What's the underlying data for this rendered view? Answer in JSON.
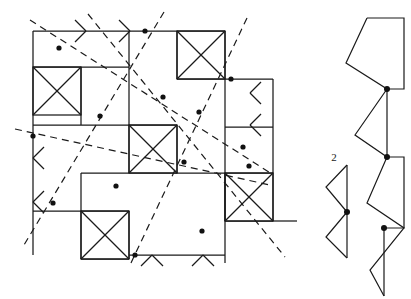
{
  "figure": {
    "kind": "geometric-line-diagram",
    "background_color": "#ffffff",
    "stroke_color": "#1a1a1a",
    "width": 411,
    "height": 299,
    "labels": [
      {
        "id": "label-2",
        "text": "2",
        "x": 334,
        "y": 161
      }
    ],
    "left_panel": {
      "name": "pinwheel-tiling-panel",
      "grid_origin_x": 33,
      "grid_origin_y": 31,
      "cell_size": 48,
      "description": "Square tiling of orthogonal segments with X-crossed cells, overlaid by dashed lines carrying marked vertex dots, with arrowheads along boundary edges.",
      "orthogonal_segments": [
        [
          33,
          31,
          33,
          255
        ],
        [
          33,
          31,
          81,
          31
        ],
        [
          81,
          31,
          129,
          31
        ],
        [
          129,
          31,
          177,
          31
        ],
        [
          177,
          31,
          225,
          31
        ],
        [
          33,
          67,
          81,
          67
        ],
        [
          81,
          67,
          129,
          67
        ],
        [
          177,
          31,
          177,
          79
        ],
        [
          225,
          31,
          225,
          79
        ],
        [
          33,
          125,
          81,
          125
        ],
        [
          81,
          125,
          129,
          125
        ],
        [
          129,
          125,
          177,
          125
        ],
        [
          81,
          67,
          81,
          125
        ],
        [
          129,
          31,
          129,
          125
        ],
        [
          177,
          79,
          225,
          79
        ],
        [
          225,
          79,
          273,
          79
        ],
        [
          225,
          79,
          225,
          127
        ],
        [
          273,
          79,
          273,
          127
        ],
        [
          129,
          125,
          129,
          173
        ],
        [
          177,
          125,
          177,
          173
        ],
        [
          129,
          173,
          177,
          173
        ],
        [
          177,
          173,
          225,
          173
        ],
        [
          225,
          127,
          273,
          127
        ],
        [
          33,
          211,
          81,
          211
        ],
        [
          81,
          211,
          129,
          211
        ],
        [
          81,
          173,
          81,
          211
        ],
        [
          81,
          173,
          129,
          173
        ],
        [
          225,
          173,
          225,
          221
        ],
        [
          273,
          173,
          273,
          221
        ],
        [
          225,
          173,
          273,
          173
        ],
        [
          225,
          221,
          273,
          221
        ],
        [
          273,
          221,
          297,
          221
        ],
        [
          81,
          211,
          81,
          259
        ],
        [
          129,
          211,
          129,
          259
        ],
        [
          81,
          259,
          129,
          259
        ],
        [
          129,
          255,
          177,
          255
        ],
        [
          177,
          255,
          225,
          255
        ],
        [
          225,
          173,
          225,
          263
        ],
        [
          273,
          127,
          273,
          173
        ],
        [
          225,
          127,
          225,
          173
        ]
      ],
      "x_cells": [
        {
          "x": 33,
          "y": 67,
          "size": 48
        },
        {
          "x": 177,
          "y": 31,
          "size": 48
        },
        {
          "x": 129,
          "y": 125,
          "size": 48
        },
        {
          "x": 225,
          "y": 173,
          "size": 48
        },
        {
          "x": 81,
          "y": 211,
          "size": 48
        }
      ],
      "dashed_lines": [
        {
          "id": "dashed-1",
          "x1": 30,
          "y1": 20,
          "x2": 272,
          "y2": 174
        },
        {
          "id": "dashed-2",
          "x1": 88,
          "y1": 14,
          "x2": 285,
          "y2": 257
        },
        {
          "id": "dashed-3",
          "x1": 164,
          "y1": 12,
          "x2": 24,
          "y2": 245
        },
        {
          "id": "dashed-4",
          "x1": 15,
          "y1": 129,
          "x2": 270,
          "y2": 185
        },
        {
          "id": "dashed-5",
          "x1": 247,
          "y1": 18,
          "x2": 130,
          "y2": 265
        }
      ],
      "vertex_dots": [
        {
          "x": 59,
          "y": 48
        },
        {
          "x": 100,
          "y": 116
        },
        {
          "x": 145,
          "y": 31
        },
        {
          "x": 163,
          "y": 97
        },
        {
          "x": 199,
          "y": 112
        },
        {
          "x": 231,
          "y": 79
        },
        {
          "x": 243,
          "y": 147
        },
        {
          "x": 33,
          "y": 136
        },
        {
          "x": 53,
          "y": 203
        },
        {
          "x": 116,
          "y": 186
        },
        {
          "x": 184,
          "y": 162
        },
        {
          "x": 202,
          "y": 231
        },
        {
          "x": 135,
          "y": 255
        },
        {
          "x": 249,
          "y": 166
        }
      ],
      "edge_arrows": [
        {
          "id": "arrow-top-1",
          "x": 86,
          "y": 31,
          "dir": "right-on-horizontal"
        },
        {
          "id": "arrow-top-2",
          "x": 130,
          "y": 31,
          "dir": "right-on-horizontal"
        },
        {
          "id": "arrow-left-1",
          "x": 33,
          "y": 158,
          "dir": "down-on-vertical"
        },
        {
          "id": "arrow-left-2",
          "x": 33,
          "y": 202,
          "dir": "down-on-vertical"
        },
        {
          "id": "arrow-right-1",
          "x": 250,
          "y": 93,
          "dir": "down-on-vertical"
        },
        {
          "id": "arrow-right-2",
          "x": 250,
          "y": 125,
          "dir": "down-on-vertical"
        },
        {
          "id": "arrow-bottom-1",
          "x": 152,
          "y": 255,
          "dir": "up-on-horizontal"
        },
        {
          "id": "arrow-bottom-2",
          "x": 203,
          "y": 255,
          "dir": "up-on-horizontal"
        }
      ]
    },
    "right_panel": {
      "name": "zigzag-polygon-panel",
      "description": "A zig-zag chain of quadrilateral cells joined at marked vertex dots, plus a separate bowtie (two triangles) labelled 2.",
      "zigzag_points": [
        [
          367,
          18
        ],
        [
          404,
          18
        ],
        [
          404,
          89
        ],
        [
          387,
          89
        ],
        [
          387,
          157
        ],
        [
          404,
          157
        ],
        [
          404,
          228
        ],
        [
          384,
          228
        ],
        [
          384,
          296
        ]
      ],
      "zigzag_left_chain": [
        [
          367,
          18
        ],
        [
          346,
          63
        ],
        [
          387,
          89
        ],
        [
          355,
          135
        ],
        [
          387,
          157
        ],
        [
          367,
          203
        ],
        [
          404,
          228
        ],
        [
          370,
          270
        ],
        [
          384,
          296
        ]
      ],
      "zigzag_dots": [
        {
          "x": 387,
          "y": 89
        },
        {
          "x": 387,
          "y": 157
        },
        {
          "x": 384,
          "y": 228
        }
      ],
      "bowtie": {
        "spine": [
          347,
          165,
          347,
          258
        ],
        "upper_vertex": [
          326,
          187
        ],
        "lower_vertex": [
          326,
          237
        ],
        "dot": {
          "x": 347,
          "y": 212
        }
      }
    }
  }
}
